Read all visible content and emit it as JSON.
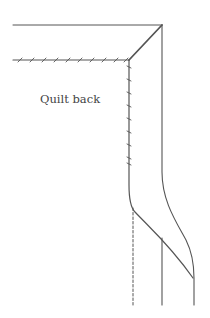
{
  "diagram": {
    "labels": {
      "quilt_back": "Quilt back"
    },
    "colors": {
      "line": "#555555",
      "background": "#ffffff"
    },
    "elements": [
      "top-edge-line",
      "mitered-corner-diagonal",
      "stitched-top-binding-line",
      "stitched-side-binding-line",
      "outer-binding-edge",
      "fold-curve",
      "inner-vertical-line",
      "dashed-fold-line"
    ]
  }
}
